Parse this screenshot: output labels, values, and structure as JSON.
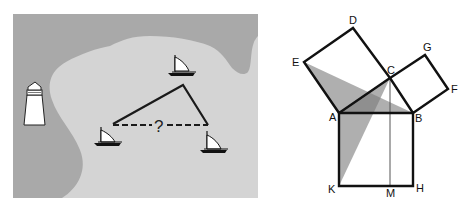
{
  "map": {
    "question_mark": "?",
    "colors": {
      "land": "#a9a9a9",
      "water": "#d4d4d4",
      "line": "#1a1a1a",
      "lighthouse": "#ffffff"
    }
  },
  "proof": {
    "labels": {
      "A": "A",
      "B": "B",
      "C": "C",
      "D": "D",
      "E": "E",
      "F": "F",
      "G": "G",
      "H": "H",
      "K": "K",
      "M": "M"
    },
    "colors": {
      "shade": "#7a7a7a",
      "line": "#111111"
    }
  }
}
